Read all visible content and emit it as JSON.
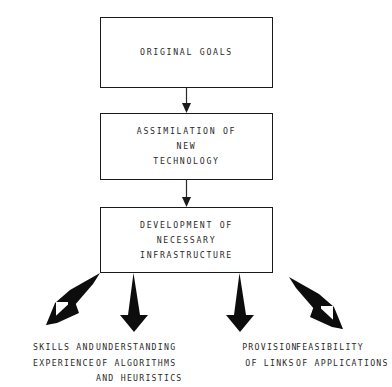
{
  "diagram": {
    "type": "flowchart",
    "background_color": "#ffffff",
    "line_color": "#1a1a1a",
    "text_color": "#2a2a2a"
  },
  "boxes": [
    {
      "id": "original-goals",
      "text": "ORIGINAL GOALS"
    },
    {
      "id": "assimilation",
      "text": "ASSIMILATION OF\nNEW\nTECHNOLOGY"
    },
    {
      "id": "development",
      "text": "DEVELOPMENT OF\nNECESSARY\nINFRASTRUCTURE"
    }
  ],
  "connectors": [
    {
      "id": "goals-to-assimilation",
      "from": "original-goals",
      "to": "assimilation",
      "style": "thin-arrow-down"
    },
    {
      "id": "assimilation-to-development",
      "from": "assimilation",
      "to": "development",
      "style": "thin-arrow-down"
    }
  ],
  "outcomes": [
    {
      "id": "skills",
      "text": "SKILLS AND\nEXPERIENCE",
      "arrow": "thick-diagonal-down-left"
    },
    {
      "id": "algorithms",
      "text": "UNDERSTANDING\nOF ALGORITHMS\nAND HEURISTICS",
      "arrow": "thick-vertical-down"
    },
    {
      "id": "links",
      "text": "PROVISION\nOF LINKS",
      "arrow": "thick-vertical-down"
    },
    {
      "id": "feasibility",
      "text": "FEASIBILITY\nOF APPLICATIONS",
      "arrow": "thick-diagonal-down-right"
    }
  ]
}
